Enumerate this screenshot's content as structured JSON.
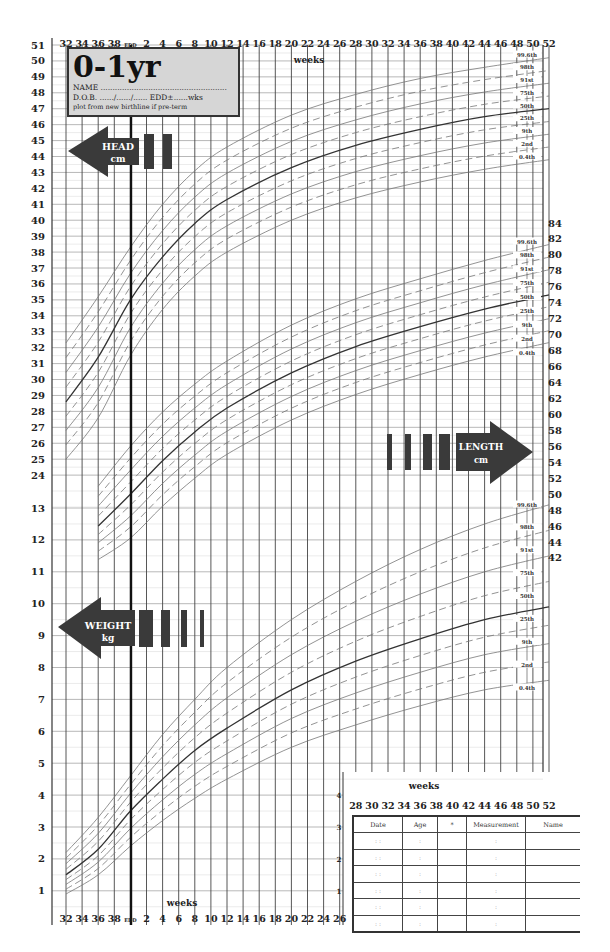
{
  "title": {
    "main": "0-1yr",
    "name_line": "NAME .....................................................",
    "dob_line": "D.O.B. ....../....../...... EDD±......wks",
    "note": "plot from new birthline if pre-term"
  },
  "axes": {
    "top_weeks": [
      "32",
      "34",
      "36",
      "38",
      "EDD",
      "2",
      "4",
      "6",
      "8",
      "10",
      "12",
      "14",
      "16",
      "18",
      "20",
      "22",
      "24",
      "26",
      "28",
      "30",
      "32",
      "34",
      "36",
      "38",
      "40",
      "42",
      "44",
      "46",
      "48",
      "50",
      "52"
    ],
    "bottom_weeks": [
      "32",
      "34",
      "36",
      "38",
      "EDD",
      "2",
      "4",
      "6",
      "8",
      "10",
      "12",
      "14",
      "16",
      "18",
      "20",
      "22",
      "24",
      "26"
    ],
    "bottom_weeks_right": [
      "28",
      "30",
      "32",
      "34",
      "36",
      "38",
      "40",
      "42",
      "44",
      "46",
      "48",
      "50",
      "52"
    ],
    "weeks_label_top": "weeks",
    "weeks_label_bottom": "weeks",
    "weeks_label_right": "weeks",
    "head_ticks": [
      "51",
      "50",
      "49",
      "48",
      "47",
      "46",
      "45",
      "44",
      "43",
      "42",
      "41",
      "40",
      "39",
      "38",
      "37",
      "36",
      "35",
      "34",
      "33",
      "32",
      "31",
      "30",
      "29",
      "28",
      "27",
      "26",
      "25",
      "24"
    ],
    "weight_ticks": [
      "13",
      "12",
      "11",
      "10",
      "9",
      "8",
      "7",
      "6",
      "5",
      "4",
      "3",
      "2",
      "1"
    ],
    "length_ticks": [
      "84",
      "82",
      "80",
      "78",
      "76",
      "74",
      "72",
      "70",
      "68",
      "66",
      "64",
      "62",
      "60",
      "58",
      "56",
      "54",
      "52",
      "50",
      "48",
      "46",
      "44",
      "42"
    ],
    "inner_weight_ticks": [
      "4",
      "3",
      "2",
      "1"
    ]
  },
  "arrows": {
    "head": {
      "line1": "HEAD",
      "line2": "cm"
    },
    "length": {
      "line1": "LENGTH",
      "line2": "cm"
    },
    "weight": {
      "line1": "WEIGHT",
      "line2": "kg"
    }
  },
  "centile_labels": [
    "99.6th",
    "98th",
    "91st",
    "75th",
    "50th",
    "25th",
    "9th",
    "2nd",
    "0.4th"
  ],
  "record_table": {
    "headers": [
      "Date",
      "Age",
      "*",
      "Measurement",
      "Name"
    ],
    "rows": [
      [
        ": :",
        ":",
        "",
        ":",
        ""
      ],
      [
        ": :",
        ":",
        "",
        ":",
        ""
      ],
      [
        ": :",
        ":",
        "",
        ":",
        ""
      ],
      [
        ": :",
        ":",
        "",
        ":",
        ""
      ],
      [
        ": :",
        ":",
        "",
        ":",
        ""
      ],
      [
        ": :",
        ":",
        "",
        ":",
        ""
      ]
    ]
  },
  "chart_data": [
    {
      "type": "line",
      "title": "Head circumference 0-1yr",
      "xlabel": "weeks (gestation 32-40 then age 0-52)",
      "ylabel": "HEAD cm",
      "ylim": [
        24,
        51
      ],
      "x": [
        32,
        36,
        40,
        44,
        48,
        52,
        60,
        68,
        76,
        84,
        92
      ],
      "series": [
        {
          "name": "99.6th",
          "values": [
            32.3,
            35.2,
            38.3,
            41.0,
            43.1,
            44.6,
            46.6,
            47.9,
            48.9,
            49.6,
            50.2
          ]
        },
        {
          "name": "50th",
          "values": [
            28.6,
            31.4,
            35.0,
            37.7,
            39.8,
            41.3,
            43.3,
            44.7,
            45.7,
            46.5,
            47.0
          ]
        },
        {
          "name": "0.4th",
          "values": [
            25.0,
            27.6,
            31.5,
            34.4,
            36.5,
            38.0,
            40.0,
            41.4,
            42.4,
            43.2,
            43.8
          ]
        }
      ]
    },
    {
      "type": "line",
      "title": "Length 0-1yr",
      "ylabel": "LENGTH cm",
      "ylim": [
        42,
        84
      ],
      "x": [
        36,
        40,
        44,
        48,
        52,
        60,
        68,
        76,
        84,
        92
      ],
      "series": [
        {
          "name": "99.6th",
          "values": [
            51.0,
            56.0,
            60.3,
            63.8,
            66.7,
            71.2,
            74.5,
            77.0,
            79.3,
            81.3
          ]
        },
        {
          "name": "50th",
          "values": [
            46.0,
            50.0,
            54.2,
            57.8,
            60.8,
            65.2,
            68.5,
            71.0,
            73.2,
            75.0
          ]
        },
        {
          "name": "0.4th",
          "values": [
            41.8,
            44.5,
            48.5,
            52.0,
            55.0,
            59.3,
            62.5,
            65.0,
            67.2,
            69.0
          ]
        }
      ]
    },
    {
      "type": "line",
      "title": "Weight 0-1yr",
      "ylabel": "WEIGHT kg",
      "ylim": [
        1,
        13
      ],
      "x": [
        32,
        36,
        40,
        44,
        48,
        52,
        60,
        68,
        76,
        84,
        92
      ],
      "series": [
        {
          "name": "99.6th",
          "values": [
            2.2,
            3.3,
            4.6,
            5.9,
            7.0,
            8.0,
            9.5,
            10.7,
            11.7,
            12.5,
            13.1
          ]
        },
        {
          "name": "50th",
          "values": [
            1.5,
            2.3,
            3.5,
            4.5,
            5.4,
            6.1,
            7.3,
            8.2,
            8.9,
            9.5,
            9.9
          ]
        },
        {
          "name": "0.4th",
          "values": [
            0.9,
            1.5,
            2.4,
            3.2,
            3.9,
            4.5,
            5.5,
            6.2,
            6.8,
            7.3,
            7.6
          ]
        }
      ]
    }
  ]
}
